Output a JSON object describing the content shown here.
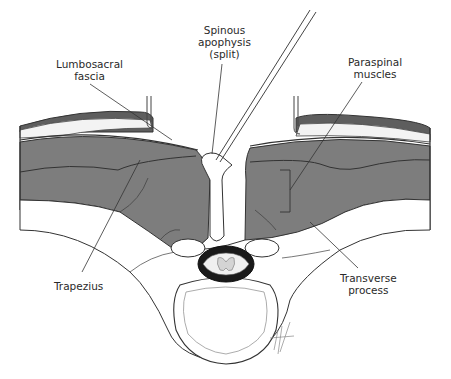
{
  "figure": {
    "type": "anatomical-illustration",
    "view": "axial cross-section, posterior lumbar approach"
  },
  "labels": {
    "spinous": {
      "line1": "Spinous",
      "line2": "apophysis",
      "line3": "(split)"
    },
    "lumbosacral": {
      "line1": "Lumbosacral",
      "line2": "fascia"
    },
    "paraspinal": {
      "line1": "Paraspinal",
      "line2": "muscles"
    },
    "trapezius": {
      "line1": "Trapezius"
    },
    "transverse": {
      "line1": "Transverse",
      "line2": "process"
    }
  },
  "colors": {
    "muscle": "#7d7d7d",
    "skin": "#5e5e5e",
    "fat": "#f3f3f3",
    "canal": "#1a1a1a",
    "bone": "#ffffff",
    "line": "#333333"
  }
}
